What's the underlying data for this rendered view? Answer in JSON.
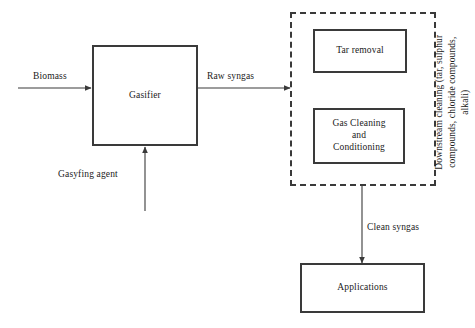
{
  "diagram": {
    "background_color": "#ffffff",
    "line_color": "#3a3a3a",
    "text_color": "#1a1a1a"
  },
  "nodes": {
    "gasifier": {
      "label": "Gasifier"
    },
    "tar_removal": {
      "label": "Tar removal"
    },
    "gas_cleaning": {
      "label": "Gas Cleaning\nand\nConditioning"
    },
    "applications": {
      "label": "Applications"
    }
  },
  "group": {
    "side_label": "Downstream cleaning (tar, sulphur\ncompounds, chloride compounds,\nalkali)"
  },
  "flows": {
    "biomass": {
      "label": "Biomass"
    },
    "gasifying_agent": {
      "label": "Gasyfing agent"
    },
    "raw_syngas": {
      "label": "Raw syngas"
    },
    "clean_syngas": {
      "label": "Clean syngas"
    }
  }
}
